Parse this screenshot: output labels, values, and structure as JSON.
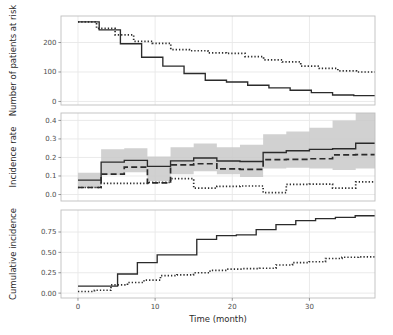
{
  "figure": {
    "background": "#ffffff",
    "panel_background": "#ffffff",
    "panel_border_color": "#bfbfbf",
    "grid_color": "#e8e8e8",
    "ribbon_color": "#c9c9c9",
    "line_color": "#2b2b2b",
    "xlabel": "Time (month)",
    "x_ticks": [
      0,
      10,
      20,
      30
    ],
    "x_tick_labels": [
      "0",
      "10",
      "20",
      "30"
    ],
    "xlim": [
      -2.2,
      38.5
    ]
  },
  "panels": [
    {
      "id": "patients-at-risk",
      "ylabel": "Number of patients at risk",
      "y_ticks": [
        0,
        100,
        200
      ],
      "y_tick_labels": [
        "0",
        "100",
        "200"
      ],
      "ylim": [
        -12,
        290
      ]
    },
    {
      "id": "incidence-rate",
      "ylabel": "Incidence rate",
      "y_ticks": [
        0.0,
        0.1,
        0.2,
        0.3,
        0.4
      ],
      "y_tick_labels": [
        "0.0",
        "0.1",
        "0.2",
        "0.3",
        "0.4"
      ],
      "ylim": [
        -0.035,
        0.44
      ]
    },
    {
      "id": "cumulative-incidence",
      "ylabel": "Cumulative incidence",
      "y_ticks": [
        0.0,
        0.25,
        0.5,
        0.75
      ],
      "y_tick_labels": [
        "0.00",
        "0.25",
        "0.50",
        "0.75"
      ],
      "ylim": [
        -0.06,
        1.02
      ]
    }
  ],
  "chart_data": [
    {
      "type": "line",
      "id": "patients-at-risk",
      "title": "",
      "xlabel": "",
      "ylabel": "Number of patients at risk",
      "xlim": [
        -2.2,
        38.5
      ],
      "ylim": [
        -12,
        290
      ],
      "x_ticks": [
        0,
        10,
        20,
        30
      ],
      "y_ticks": [
        0,
        100,
        200
      ],
      "grid": true,
      "step": "post",
      "legend": "none",
      "series": [
        {
          "name": "solid",
          "style": "solid",
          "x": [
            0,
            3,
            6,
            9,
            12,
            15,
            18,
            21,
            24,
            27,
            30,
            33,
            36
          ],
          "values": [
            270,
            243,
            196,
            150,
            120,
            95,
            72,
            66,
            55,
            46,
            38,
            30,
            22,
            20
          ]
        },
        {
          "name": "dotted",
          "style": "dotted",
          "x": [
            0,
            3,
            6,
            9,
            12,
            15,
            18,
            21,
            24,
            27,
            30,
            33,
            36
          ],
          "values": [
            270,
            248,
            226,
            204,
            197,
            176,
            172,
            165,
            163,
            152,
            141,
            134,
            120,
            112,
            104,
            100
          ]
        }
      ]
    },
    {
      "type": "line",
      "id": "incidence-rate",
      "title": "",
      "xlabel": "",
      "ylabel": "Incidence rate",
      "xlim": [
        -2.2,
        38.5
      ],
      "ylim": [
        -0.035,
        0.44
      ],
      "x_ticks": [
        0,
        10,
        20,
        30
      ],
      "y_ticks": [
        0.0,
        0.1,
        0.2,
        0.3,
        0.4
      ],
      "grid": true,
      "step": "post",
      "legend": "none",
      "series": [
        {
          "name": "solid",
          "style": "solid",
          "x": [
            0,
            3,
            6,
            9,
            12,
            15,
            18,
            21,
            24,
            27,
            30,
            33,
            36
          ],
          "values": [
            0.078,
            0.175,
            0.184,
            0.152,
            0.182,
            0.197,
            0.181,
            0.178,
            0.227,
            0.236,
            0.244,
            0.247,
            0.277
          ],
          "ci_lower": [
            0.038,
            0.105,
            0.12,
            0.073,
            0.11,
            0.125,
            0.11,
            0.095,
            0.14,
            0.145,
            0.14,
            0.132,
            0.14
          ],
          "ci_upper": [
            0.118,
            0.245,
            0.25,
            0.205,
            0.255,
            0.275,
            0.255,
            0.268,
            0.325,
            0.34,
            0.36,
            0.4,
            0.44
          ]
        },
        {
          "name": "dashed",
          "style": "dashed",
          "x": [
            0,
            3,
            6,
            9,
            12,
            15,
            18,
            21,
            24,
            27,
            30,
            33,
            36
          ],
          "values": [
            0.038,
            0.11,
            0.148,
            0.063,
            0.16,
            0.166,
            0.138,
            0.136,
            0.188,
            0.19,
            0.193,
            0.214,
            0.215
          ]
        },
        {
          "name": "dotted",
          "style": "dotted",
          "x": [
            0,
            3,
            6,
            9,
            12,
            15,
            18,
            21,
            24,
            27,
            30,
            33,
            36
          ],
          "values": [
            0.038,
            0.06,
            0.06,
            0.066,
            0.086,
            0.034,
            0.044,
            0.046,
            0.01,
            0.055,
            0.056,
            0.035,
            0.068
          ]
        }
      ]
    },
    {
      "type": "line",
      "id": "cumulative-incidence",
      "title": "",
      "xlabel": "Time (month)",
      "ylabel": "Cumulative incidence",
      "xlim": [
        -2.2,
        38.5
      ],
      "ylim": [
        -0.06,
        1.02
      ],
      "x_ticks": [
        0,
        10,
        20,
        30
      ],
      "y_ticks": [
        0.0,
        0.25,
        0.5,
        0.75
      ],
      "grid": true,
      "step": "post",
      "legend": "none",
      "series": [
        {
          "name": "solid",
          "style": "solid",
          "x": [
            0,
            3,
            6,
            9,
            12,
            15,
            18,
            21,
            24,
            27,
            30,
            33,
            36
          ],
          "values": [
            0.085,
            0.085,
            0.235,
            0.375,
            0.47,
            0.47,
            0.66,
            0.705,
            0.715,
            0.78,
            0.84,
            0.89,
            0.915,
            0.93,
            0.95
          ]
        },
        {
          "name": "dotted",
          "style": "dotted",
          "x": [
            0,
            3,
            6,
            9,
            12,
            15,
            18,
            21,
            24,
            27,
            30,
            33,
            36
          ],
          "values": [
            0.02,
            0.035,
            0.1,
            0.13,
            0.16,
            0.215,
            0.225,
            0.25,
            0.28,
            0.295,
            0.3,
            0.305,
            0.345,
            0.375,
            0.385,
            0.425,
            0.44,
            0.445
          ]
        }
      ]
    }
  ]
}
